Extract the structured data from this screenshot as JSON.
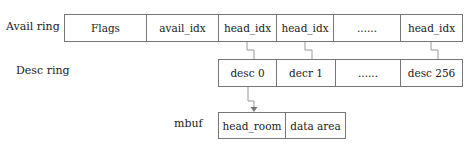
{
  "labels": {
    "avail_ring": "Avail ring",
    "desc_ring": "Desc ring",
    "mbuf": "mbuf"
  },
  "avail_ring": [
    "Flags",
    "avail_idx",
    "head_idx",
    "head_idx",
    "......",
    "head_idx"
  ],
  "desc_ring": [
    "desc 0",
    "decr 1",
    "......",
    "desc 256"
  ],
  "mbuf": [
    "head_room",
    "data area"
  ],
  "connections": [
    {
      "from": "avail_ring.2",
      "to": "desc_ring.0"
    },
    {
      "from": "avail_ring.3",
      "to": "desc_ring.1"
    },
    {
      "from": "avail_ring.5",
      "to": "desc_ring.3"
    },
    {
      "from": "desc_ring.0",
      "to": "mbuf.0",
      "arrow": true
    }
  ]
}
